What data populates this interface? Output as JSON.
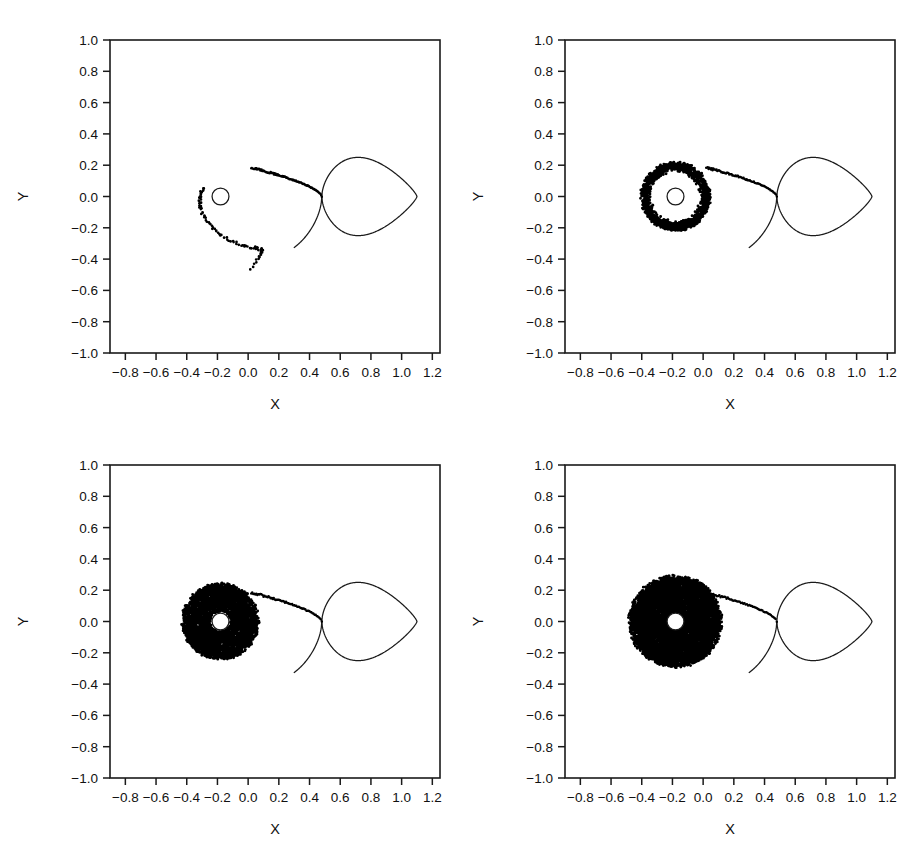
{
  "figure": {
    "title": "",
    "panel_count": 4,
    "background_color": "#ffffff",
    "ink_color": "#000000",
    "layout": "2x2 grid"
  },
  "axes": {
    "xlabel": "X",
    "ylabel": "Y",
    "xlim": [
      -0.9,
      1.25
    ],
    "ylim": [
      -1.0,
      1.0
    ],
    "xticks": [
      -0.8,
      -0.6,
      -0.4,
      -0.2,
      0.0,
      0.2,
      0.4,
      0.6,
      0.8,
      1.0,
      1.2
    ],
    "yticks": [
      -1.0,
      -0.8,
      -0.6,
      -0.4,
      -0.2,
      0.0,
      0.2,
      0.4,
      0.6,
      0.8,
      1.0
    ],
    "xticklabels": [
      "−0.8",
      "−0.6",
      "−0.4",
      "−0.2",
      "0.0",
      "0.2",
      "0.4",
      "0.6",
      "0.8",
      "1.0",
      "1.2"
    ],
    "yticklabels": [
      "−1.0",
      "−0.8",
      "−0.6",
      "−0.4",
      "−0.2",
      "0.0",
      "0.2",
      "0.4",
      "0.6",
      "0.8",
      "1.0"
    ],
    "grid": false,
    "tick_direction": "out",
    "frame": "box"
  },
  "chart_data": {
    "type": "scatter",
    "title": "",
    "xlabel": "X",
    "ylabel": "Y",
    "xlim": [
      -0.9,
      1.25
    ],
    "ylim": [
      -1.0,
      1.0
    ],
    "grid": false,
    "legend": null,
    "shared_geometry": {
      "accretor_center": [
        -0.18,
        0.0
      ],
      "accretor_radius": 0.055,
      "L1_point": [
        0.48,
        0.0
      ],
      "donor_lobe_center": [
        0.84,
        0.0
      ],
      "donor_lobe_rx": 0.27,
      "donor_lobe_ry": 0.25,
      "donor_lobe_xmax": 1.1,
      "donor_lobe_ymax": 0.25,
      "primary_lobe_xmin": -0.62,
      "stream_start": [
        0.48,
        0.0
      ],
      "stream_impact": [
        0.02,
        0.175
      ]
    },
    "panels": [
      {
        "index": 0,
        "position": "top-left",
        "label": "",
        "seed": 1101,
        "n_particles": 190,
        "stream_points": 110,
        "disc": {
          "present": false,
          "inner_radius": 0.0,
          "outer_radius": 0.0,
          "fill_fraction": 0.0,
          "n_disc_particles": 0
        },
        "ballistic_tail": {
          "present": true,
          "n_points": 90,
          "description": "single ballistic trajectory wrapping past the accretor and plunging to a cusp near (0.02, -0.46)",
          "cusp": [
            0.02,
            -0.46
          ],
          "y_min": -0.47,
          "x_range": [
            -0.32,
            0.09
          ]
        }
      },
      {
        "index": 1,
        "position": "top-right",
        "label": "",
        "seed": 2202,
        "n_particles": 1400,
        "stream_points": 90,
        "disc": {
          "present": true,
          "inner_radius": 0.085,
          "outer_radius": 0.22,
          "fill_fraction": 0.55,
          "n_disc_particles": 1300,
          "shape": "narrow ragged annulus / partial ring"
        },
        "ballistic_tail": {
          "present": false,
          "n_points": 0
        }
      },
      {
        "index": 2,
        "position": "bottom-left",
        "label": "",
        "seed": 3303,
        "n_particles": 4200,
        "stream_points": 70,
        "disc": {
          "present": true,
          "inner_radius": 0.065,
          "outer_radius": 0.245,
          "fill_fraction": 0.9,
          "n_disc_particles": 4100,
          "shape": "thick filled annulus with clear inner hole"
        },
        "ballistic_tail": {
          "present": false,
          "n_points": 0
        }
      },
      {
        "index": 3,
        "position": "bottom-right",
        "label": "",
        "seed": 4404,
        "n_particles": 7000,
        "stream_points": 60,
        "disc": {
          "present": true,
          "inner_radius": 0.055,
          "outer_radius": 0.295,
          "fill_fraction": 1.0,
          "n_disc_particles": 6900,
          "shape": "large dense disc, nearly opaque, small central hole"
        },
        "ballistic_tail": {
          "present": false,
          "n_points": 0
        }
      }
    ]
  }
}
